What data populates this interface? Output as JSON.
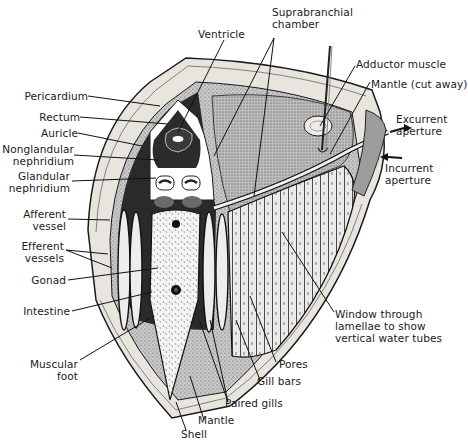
{
  "diagram": {
    "colors": {
      "ink": "#1a1a1a",
      "background": "#ffffff",
      "stipple": "#9a9a9a",
      "shell_fill": "#e6e3dc",
      "nephridium": "#6a6a6a"
    },
    "labels": {
      "pericardium": "Pericardium",
      "rectum": "Rectum",
      "auricle": "Auricle",
      "nonglandular_1": "Nonglandular",
      "nonglandular_2": "nephridium",
      "glandular_1": "Glandular",
      "glandular_2": "nephridium",
      "afferent_1": "Afferent",
      "afferent_2": "vessel",
      "efferent_1": "Efferent",
      "efferent_2": "vessels",
      "gonad": "Gonad",
      "intestine": "Intestine",
      "muscular_foot_1": "Muscular",
      "muscular_foot_2": "foot",
      "ventricle": "Ventricle",
      "suprabranchial_1": "Suprabranchial",
      "suprabranchial_2": "chamber",
      "adductor": "Adductor muscle",
      "mantle_cut": "Mantle (cut away)",
      "excurrent_1": "Excurrent",
      "excurrent_2": "aperture",
      "incurrent_1": "Incurrent",
      "incurrent_2": "aperture",
      "window_1": "Window through",
      "window_2": "lamellae to show",
      "window_3": "vertical water tubes",
      "pores": "Pores",
      "gill_bars": "Gill bars",
      "paired_gills": "Paired gills",
      "mantle": "Mantle",
      "shell": "Shell"
    }
  }
}
